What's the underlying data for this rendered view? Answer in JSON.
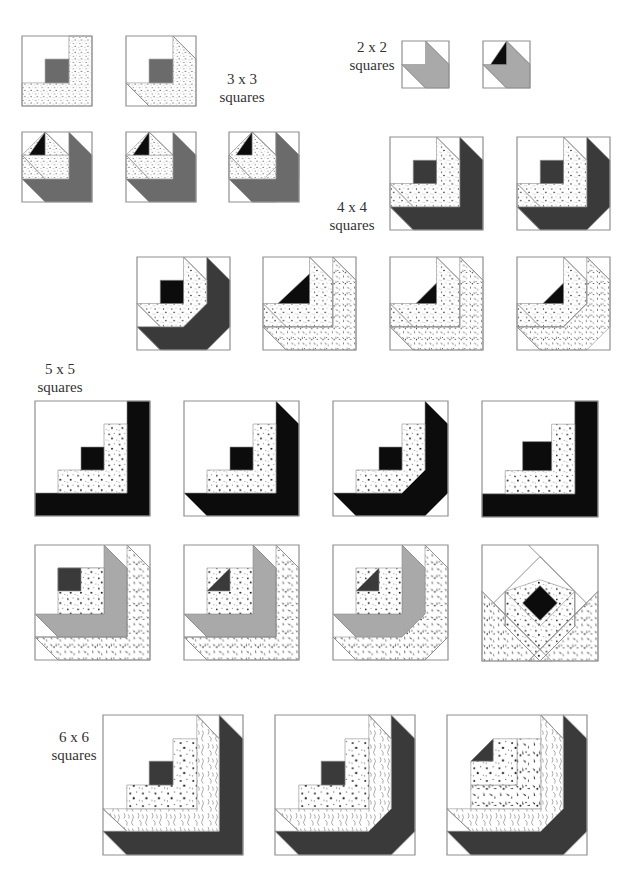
{
  "colors": {
    "outline": "#8f8f8f",
    "dark": "#3a3a3a",
    "medium": "#6b6b6b",
    "light_gray": "#a9a9a9",
    "black": "#0c0c0c",
    "white": "#ffffff",
    "text": "#333333"
  },
  "labels": [
    {
      "id": "3x3",
      "line1": "3 x 3",
      "line2": "squares",
      "x": 212,
      "y": 70,
      "w": 60
    },
    {
      "id": "2x2",
      "line1": "2 x 2",
      "line2": "squares",
      "x": 342,
      "y": 38,
      "w": 60
    },
    {
      "id": "4x4",
      "line1": "4 x 4",
      "line2": "squares",
      "x": 322,
      "y": 198,
      "w": 60
    },
    {
      "id": "5x5",
      "line1": "5 x 5",
      "line2": "squares",
      "x": 30,
      "y": 360,
      "w": 60
    },
    {
      "id": "6x6",
      "line1": "6 x 6",
      "line2": "squares",
      "x": 44,
      "y": 728,
      "w": 60
    }
  ],
  "blocks": [
    {
      "group": "3x3",
      "x": 22,
      "y": 36,
      "size": 70,
      "shapes": [
        {
          "fill": "dots",
          "pts": "67,0 100,0 100,100 0,100 0,67 67,67"
        },
        {
          "fill": "medium",
          "pts": "33,33 67,33 67,67 33,67"
        }
      ]
    },
    {
      "group": "3x3",
      "x": 126,
      "y": 36,
      "size": 70,
      "shapes": [
        {
          "fill": "dots",
          "pts": "67,0 100,33 100,100 33,100 0,67 67,67"
        },
        {
          "fill": "medium",
          "pts": "33,33 67,33 67,67 33,67"
        },
        {
          "line": "0,67 33,100"
        },
        {
          "line": "67,0 100,33"
        }
      ]
    },
    {
      "group": "3x3",
      "x": 22,
      "y": 132,
      "size": 70,
      "shapes": [
        {
          "fill": "medium",
          "pts": "67,0 100,33 100,100 33,100 0,67 67,67"
        },
        {
          "fill": "dots",
          "pts": "33,0 67,33 67,67 33,67 0,33"
        },
        {
          "fill": "dots",
          "pts": "0,33 67,33 67,67 33,67 0,67"
        },
        {
          "fill": "black",
          "pts": "33,0 33,33 10,33"
        },
        {
          "line": "33,0 67,33"
        },
        {
          "line": "0,33 33,67"
        }
      ]
    },
    {
      "group": "3x3",
      "x": 126,
      "y": 132,
      "size": 70,
      "shapes": [
        {
          "fill": "medium",
          "pts": "67,0 100,33 100,100 33,100 0,67 67,67"
        },
        {
          "fill": "dots",
          "pts": "33,0 67,33 67,67 33,67 0,33"
        },
        {
          "fill": "dots",
          "pts": "0,33 67,33 67,67 33,67 0,67"
        },
        {
          "fill": "black",
          "pts": "33,0 33,33 10,33"
        },
        {
          "line": "33,0 67,33"
        },
        {
          "line": "0,33 33,67"
        }
      ]
    },
    {
      "group": "3x3",
      "x": 229,
      "y": 132,
      "size": 70,
      "shapes": [
        {
          "fill": "medium",
          "pts": "67,0 100,33 100,67 67,100 33,100 0,67 67,67"
        },
        {
          "fill": "medium",
          "pts": "67,0 100,33 100,100 33,100 0,67 67,67"
        },
        {
          "fill": "dots",
          "pts": "33,0 67,33 67,67 33,67 0,33"
        },
        {
          "fill": "dots",
          "pts": "0,33 67,33 67,67 33,67 0,67"
        },
        {
          "fill": "dots",
          "pts": "33,0 67,33 67,50 50,67 0,67 0,33"
        },
        {
          "fill": "black",
          "pts": "33,0 33,33 10,33"
        },
        {
          "line": "33,0 67,33"
        },
        {
          "line": "0,33 33,67"
        }
      ]
    },
    {
      "group": "2x2",
      "x": 402,
      "y": 41,
      "size": 47,
      "shapes": [
        {
          "fill": "light_gray",
          "pts": "50,0 100,50 100,100 50,100 0,50 50,50"
        },
        {
          "line": "0,50 50,100"
        },
        {
          "line": "50,0 100,50"
        }
      ]
    },
    {
      "group": "2x2",
      "x": 483,
      "y": 41,
      "size": 47,
      "shapes": [
        {
          "fill": "light_gray",
          "pts": "50,0 100,50 100,100 50,100 0,50 50,50"
        },
        {
          "fill": "black",
          "pts": "50,0 50,50 16,50"
        },
        {
          "line": "0,50 50,100"
        },
        {
          "line": "50,0 100,50"
        }
      ]
    },
    {
      "group": "4x4",
      "x": 390,
      "y": 137,
      "size": 93,
      "shapes": [
        {
          "fill": "dark",
          "pts": "75,0 100,25 100,100 25,100 0,75 75,75"
        },
        {
          "fill": "dots",
          "pts": "50,0 75,25 75,75 0,75 0,50 50,50"
        },
        {
          "fill": "dark",
          "pts": "25,25 50,25 50,50 25,50"
        },
        {
          "line": "50,0 75,25"
        },
        {
          "line": "0,50 25,75"
        },
        {
          "line": "0,75 25,100"
        }
      ]
    },
    {
      "group": "4x4",
      "x": 517,
      "y": 137,
      "size": 93,
      "shapes": [
        {
          "fill": "dark",
          "pts": "75,0 100,25 100,75 75,100 25,100 0,75 75,75"
        },
        {
          "fill": "dots",
          "pts": "50,0 75,25 75,75 0,75 0,50 50,50"
        },
        {
          "fill": "dark",
          "pts": "25,25 50,25 50,50 25,50"
        },
        {
          "line": "50,0 75,25"
        },
        {
          "line": "0,50 25,75"
        },
        {
          "line": "0,75 25,100"
        }
      ]
    },
    {
      "group": "4x4",
      "x": 137,
      "y": 257,
      "size": 93,
      "shapes": [
        {
          "fill": "dark",
          "pts": "75,0 100,25 100,75 75,100 25,100 0,75 50,75 75,50"
        },
        {
          "fill": "dots",
          "pts": "50,0 75,25 75,50 50,75 25,75 0,50 50,50"
        },
        {
          "fill": "black",
          "pts": "25,25 50,25 50,50 25,50"
        },
        {
          "line": "50,0 75,25"
        },
        {
          "line": "0,50 25,75"
        },
        {
          "line": "0,75 25,100"
        }
      ]
    },
    {
      "group": "4x4",
      "x": 263,
      "y": 257,
      "size": 93,
      "shapes": [
        {
          "fill": "speckle",
          "pts": "75,0 100,25 100,100 25,100 0,75 75,75"
        },
        {
          "fill": "dots",
          "pts": "50,0 75,25 75,75 0,75 0,50 50,50"
        },
        {
          "fill": "black",
          "pts": "50,18 50,50 16,50"
        },
        {
          "line": "50,0 75,25"
        },
        {
          "line": "0,50 25,75"
        },
        {
          "line": "0,75 25,100"
        },
        {
          "line": "75,0 100,25"
        },
        {
          "line": "75,25 75,75"
        },
        {
          "line": "0,75 75,75"
        }
      ]
    },
    {
      "group": "4x4",
      "x": 390,
      "y": 257,
      "size": 93,
      "shapes": [
        {
          "fill": "speckle",
          "pts": "75,0 100,25 100,100 25,100 0,75 75,75"
        },
        {
          "fill": "dots",
          "pts": "50,0 75,25 75,75 0,75 0,50 50,50"
        },
        {
          "fill": "black",
          "pts": "50,28 50,50 28,50"
        },
        {
          "line": "50,0 75,25"
        },
        {
          "line": "0,50 25,75"
        },
        {
          "line": "0,75 25,100"
        },
        {
          "line": "75,0 100,25"
        },
        {
          "line": "75,25 75,75"
        },
        {
          "line": "0,75 75,75"
        }
      ]
    },
    {
      "group": "4x4",
      "x": 517,
      "y": 257,
      "size": 93,
      "shapes": [
        {
          "fill": "speckle",
          "pts": "75,0 100,25 100,75 75,100 25,100 0,75 50,75 75,50"
        },
        {
          "fill": "dots",
          "pts": "50,0 75,25 75,50 50,75 0,75 0,50 50,50"
        },
        {
          "fill": "black",
          "pts": "50,28 50,50 28,50"
        },
        {
          "line": "50,0 75,25"
        },
        {
          "line": "0,50 25,75"
        },
        {
          "line": "0,75 25,100"
        },
        {
          "line": "75,0 100,25"
        },
        {
          "line": "75,25 75,50"
        },
        {
          "line": "75,50 50,75"
        },
        {
          "line": "0,75 50,75"
        }
      ]
    },
    {
      "group": "5x5",
      "x": 35,
      "y": 401,
      "size": 115,
      "shapes": [
        {
          "fill": "black",
          "pts": "80,0 100,0 100,100 0,100 0,80 80,80"
        },
        {
          "fill": "dots",
          "pts": "60,20 80,20 80,80 20,80 20,60 60,60"
        },
        {
          "fill": "black",
          "pts": "40,40 60,40 60,60 40,60"
        }
      ]
    },
    {
      "group": "5x5",
      "x": 184,
      "y": 401,
      "size": 115,
      "shapes": [
        {
          "fill": "black",
          "pts": "80,0 100,20 100,100 20,100 0,80 80,80"
        },
        {
          "fill": "dots",
          "pts": "60,20 80,20 80,80 20,80 20,60 60,60"
        },
        {
          "fill": "black",
          "pts": "40,40 60,40 60,60 40,60"
        },
        {
          "line": "0,80 20,100"
        },
        {
          "line": "80,0 100,20"
        }
      ]
    },
    {
      "group": "5x5",
      "x": 333,
      "y": 401,
      "size": 115,
      "shapes": [
        {
          "fill": "black",
          "pts": "80,0 100,20 100,80 80,100 20,100 0,80 60,80 80,60"
        },
        {
          "fill": "dots",
          "pts": "60,20 80,20 80,60 60,80 20,80 20,60 60,60"
        },
        {
          "fill": "black",
          "pts": "40,40 60,40 60,60 40,60"
        },
        {
          "line": "0,80 20,100"
        },
        {
          "line": "80,0 100,20"
        },
        {
          "line": "80,100 100,80"
        }
      ]
    },
    {
      "group": "5x5",
      "x": 482,
      "y": 401,
      "size": 116,
      "shapes": [
        {
          "fill": "black",
          "pts": "80,0 100,0 100,100 0,100 0,80 80,80"
        },
        {
          "fill": "dots",
          "pts": "60,20 80,20 80,80 20,80 20,60 60,60"
        },
        {
          "fill": "black",
          "pts": "35,35 60,35 60,60 35,60"
        }
      ]
    },
    {
      "group": "5x5",
      "x": 35,
      "y": 545,
      "size": 115,
      "shapes": [
        {
          "fill": "speckle",
          "pts": "80,0 100,20 100,100 20,100 0,80 80,80"
        },
        {
          "fill": "light_gray",
          "pts": "60,0 80,20 80,80 20,80 0,60 60,60"
        },
        {
          "fill": "dots",
          "pts": "40,20 60,20 60,60 40,60 40,40 20,40 20,20"
        },
        {
          "fill": "dots",
          "pts": "20,20 60,20 60,60 20,60"
        },
        {
          "fill": "dark",
          "pts": "20,20 40,20 40,40 20,40"
        },
        {
          "line": "0,60 20,80"
        },
        {
          "line": "60,0 80,20"
        },
        {
          "line": "0,80 20,100"
        },
        {
          "line": "80,0 100,20"
        },
        {
          "line": "80,20 80,80"
        },
        {
          "line": "0,80 80,80"
        }
      ]
    },
    {
      "group": "5x5",
      "x": 184,
      "y": 545,
      "size": 115,
      "shapes": [
        {
          "fill": "speckle",
          "pts": "80,0 100,20 100,100 20,100 0,80 80,80"
        },
        {
          "fill": "light_gray",
          "pts": "60,0 80,20 80,80 20,80 0,60 60,60"
        },
        {
          "fill": "dots",
          "pts": "20,20 60,20 60,60 20,60"
        },
        {
          "fill": "dark",
          "pts": "40,20 40,40 20,40"
        },
        {
          "line": "0,60 20,80"
        },
        {
          "line": "60,0 80,20"
        },
        {
          "line": "0,80 20,100"
        },
        {
          "line": "80,0 100,20"
        },
        {
          "line": "80,20 80,80"
        },
        {
          "line": "0,80 80,80"
        }
      ]
    },
    {
      "group": "5x5",
      "x": 333,
      "y": 545,
      "size": 115,
      "shapes": [
        {
          "fill": "speckle",
          "pts": "80,0 100,20 100,80 80,100 20,100 0,80 60,80 80,60"
        },
        {
          "fill": "light_gray",
          "pts": "60,0 80,20 80,60 60,80 20,80 0,60 60,60"
        },
        {
          "fill": "dots",
          "pts": "20,20 60,20 60,60 20,60"
        },
        {
          "fill": "dark",
          "pts": "40,20 40,40 20,40"
        },
        {
          "line": "0,60 20,80"
        },
        {
          "line": "60,0 80,20"
        },
        {
          "line": "0,80 20,100"
        },
        {
          "line": "80,0 100,20"
        },
        {
          "line": "80,100 100,80"
        }
      ]
    },
    {
      "group": "5x5",
      "x": 482,
      "y": 545,
      "size": 116,
      "shapes": [
        {
          "fill": "speckle",
          "pts": "0,40 60,100 0,100"
        },
        {
          "fill": "speckle",
          "pts": "100,40 100,100 40,100"
        },
        {
          "fill": "dots",
          "pts": "20,40 50,70 80,40 80,70 50,100 20,70"
        },
        {
          "fill": "dots",
          "pts": "20,40 50,70 80,40 50,30"
        },
        {
          "fill": "black",
          "pts": "50,35 65,50 50,65 35,50"
        },
        {
          "line": "40,0 50,10 80,40"
        },
        {
          "line": "50,10 10,50"
        },
        {
          "line": "50,10 90,50"
        },
        {
          "line": "10,50 50,90 90,50"
        },
        {
          "line": "20,40 20,70"
        },
        {
          "line": "80,40 80,70"
        },
        {
          "line": "20,70 50,100 80,70"
        },
        {
          "line": "0,40 60,100"
        },
        {
          "line": "100,40 40,100"
        }
      ]
    },
    {
      "group": "6x6",
      "x": 103,
      "y": 715,
      "size": 140,
      "shapes": [
        {
          "fill": "dark",
          "pts": "83,0 100,17 100,100 17,100 0,83 83,83"
        },
        {
          "fill": "wavy",
          "pts": "67,0 83,17 83,83 17,83 0,67 67,67"
        },
        {
          "fill": "dots",
          "pts": "50,17 67,17 67,67 17,67 17,50 50,50"
        },
        {
          "fill": "dark",
          "pts": "33,33 50,33 50,50 33,50"
        },
        {
          "line": "67,0 83,17"
        },
        {
          "line": "0,67 17,83"
        },
        {
          "line": "0,83 17,100"
        },
        {
          "line": "83,0 100,17"
        }
      ]
    },
    {
      "group": "6x6",
      "x": 275,
      "y": 715,
      "size": 140,
      "shapes": [
        {
          "fill": "dark",
          "pts": "83,0 100,17 100,83 83,100 17,100 0,83 67,83 83,67"
        },
        {
          "fill": "wavy",
          "pts": "67,0 83,17 83,67 67,83 17,83 0,67 67,67"
        },
        {
          "fill": "dots",
          "pts": "50,17 67,17 67,67 17,67 17,50 50,50"
        },
        {
          "fill": "dark",
          "pts": "33,33 50,33 50,50 33,50"
        },
        {
          "line": "67,0 83,17"
        },
        {
          "line": "0,67 17,83"
        },
        {
          "line": "0,83 17,100"
        },
        {
          "line": "83,0 100,17"
        },
        {
          "line": "83,100 100,83"
        }
      ]
    },
    {
      "group": "6x6",
      "x": 447,
      "y": 715,
      "size": 140,
      "shapes": [
        {
          "fill": "dark",
          "pts": "83,0 100,17 100,83 83,100 17,100 0,83 67,83 83,67"
        },
        {
          "fill": "wavy",
          "pts": "67,0 83,17 83,67 67,83 17,83 0,67 67,67"
        },
        {
          "fill": "speckle",
          "pts": "50,17 67,17 67,67 17,67 17,50 50,50"
        },
        {
          "fill": "dots",
          "pts": "33,17 50,17 50,50 17,50 17,33"
        },
        {
          "fill": "dark",
          "pts": "33,17 33,33 17,33"
        },
        {
          "line": "67,0 83,17"
        },
        {
          "line": "0,67 17,83"
        },
        {
          "line": "0,83 17,100"
        },
        {
          "line": "83,0 100,17"
        },
        {
          "line": "83,100 100,83"
        }
      ]
    }
  ]
}
